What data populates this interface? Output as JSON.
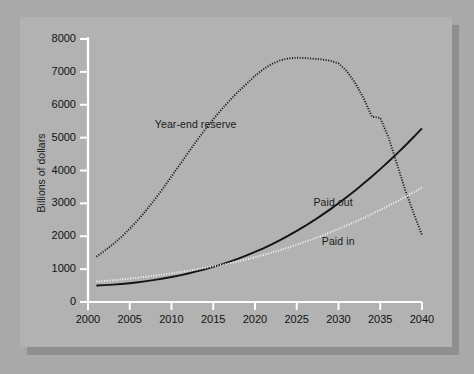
{
  "chart_data": {
    "type": "line",
    "title": "",
    "xlabel": "",
    "ylabel": "Billions of dollars",
    "xlim": [
      2000,
      2040
    ],
    "ylim": [
      0,
      8000
    ],
    "grid": false,
    "legend_position": "inline-annotations",
    "xticks": [
      "2000",
      "2005",
      "2010",
      "2015",
      "2020",
      "2025",
      "2030",
      "2035",
      "2040"
    ],
    "yticks": [
      "0",
      "1000",
      "2000",
      "3000",
      "4000",
      "5000",
      "6000",
      "7000",
      "8000"
    ],
    "x": [
      2001,
      2002,
      2003,
      2004,
      2005,
      2006,
      2007,
      2008,
      2009,
      2010,
      2011,
      2012,
      2013,
      2014,
      2015,
      2016,
      2017,
      2018,
      2019,
      2020,
      2021,
      2022,
      2023,
      2024,
      2025,
      2026,
      2027,
      2028,
      2029,
      2030,
      2031,
      2032,
      2033,
      2034,
      2035,
      2036,
      2037,
      2038,
      2039,
      2040
    ],
    "series": [
      {
        "name": "Year-end reserve",
        "style": "dotted",
        "color": "#1a1a1a",
        "label_x": 2008,
        "label_y": 5400,
        "values": [
          1380,
          1560,
          1760,
          1980,
          2230,
          2500,
          2800,
          3120,
          3460,
          3820,
          4180,
          4540,
          4900,
          5240,
          5560,
          5860,
          6140,
          6400,
          6640,
          6880,
          7080,
          7240,
          7350,
          7410,
          7430,
          7420,
          7400,
          7380,
          7340,
          7260,
          7020,
          6660,
          6200,
          5640,
          5600,
          5000,
          4200,
          3400,
          2700,
          2030
        ]
      },
      {
        "name": "Paid out",
        "style": "solid",
        "color": "#141414",
        "label_x": 2027,
        "label_y": 3050,
        "values": [
          500,
          512,
          528,
          548,
          572,
          600,
          634,
          672,
          714,
          760,
          812,
          868,
          930,
          996,
          1068,
          1146,
          1230,
          1320,
          1418,
          1522,
          1634,
          1754,
          1882,
          2018,
          2162,
          2314,
          2474,
          2642,
          2818,
          3002,
          3194,
          3394,
          3602,
          3818,
          4042,
          4274,
          4514,
          4762,
          5018,
          5280
        ]
      },
      {
        "name": "Paid in",
        "style": "dotted",
        "color": "#f2f2f2",
        "label_x": 2028,
        "label_y": 1850,
        "values": [
          620,
          640,
          662,
          686,
          712,
          740,
          770,
          802,
          836,
          872,
          910,
          950,
          992,
          1036,
          1082,
          1130,
          1182,
          1238,
          1298,
          1362,
          1430,
          1502,
          1578,
          1658,
          1742,
          1830,
          1922,
          2018,
          2118,
          2222,
          2330,
          2442,
          2558,
          2678,
          2802,
          2930,
          3062,
          3198,
          3338,
          3482
        ]
      }
    ]
  },
  "axis": {
    "line_color": "#ffffff",
    "ylabel_text": "Billions of dollars"
  },
  "panel": {
    "background": "#b2b2b2",
    "page_background": "#a9a9a9",
    "shadow_color": "#8f8f8f"
  }
}
